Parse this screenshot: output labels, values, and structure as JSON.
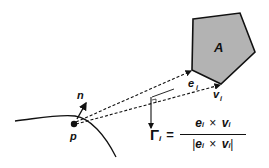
{
  "diagram": {
    "polygon_label": "A",
    "point_label": "p",
    "normal_label": "n",
    "edge_label": "e",
    "edge_sub": "i",
    "vertex_label": "v",
    "vertex_sub": "i",
    "formula": {
      "lhs": "Γ",
      "lhs_sub": "i",
      "equals": "=",
      "numerator": "e_i × v_i",
      "denominator": "|e_i × v_i|",
      "e": "e",
      "v": "v",
      "i": "i",
      "times": "×",
      "bar": "|"
    },
    "colors": {
      "polygon_fill": "#b3b3b3",
      "stroke": "#111111"
    }
  }
}
